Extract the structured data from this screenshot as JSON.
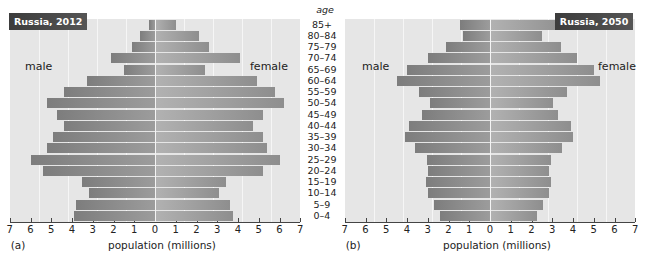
{
  "age_header": "age",
  "age_groups": [
    "85+",
    "80–84",
    "75–79",
    "70–74",
    "65–69",
    "60–64",
    "55–59",
    "50–54",
    "45–49",
    "40–44",
    "35–39",
    "30–34",
    "25–29",
    "20–24",
    "15–19",
    "10–14",
    "5–9",
    "0–4"
  ],
  "axis_ticks": [
    "7",
    "6",
    "5",
    "4",
    "3",
    "2",
    "1",
    "0",
    "1",
    "2",
    "3",
    "4",
    "5",
    "6",
    "7"
  ],
  "panels": [
    {
      "panel_label": "(a)",
      "title": "Russia, 2012",
      "male_label": "male",
      "female_label": "female",
      "xlabel": "population (millions)"
    },
    {
      "panel_label": "(b)",
      "title": "Russia, 2050",
      "male_label": "male",
      "female_label": "female",
      "xlabel": "population (millions)"
    }
  ],
  "colors": {
    "plot_bg": "#e6e6e6",
    "male_bar": "#8c8c8c",
    "female_bar": "#a4a4a4",
    "badge_bg": "#444444"
  },
  "chart_data": [
    {
      "type": "bar",
      "orientation": "horizontal-population-pyramid",
      "title": "Russia, 2012",
      "panel": "(a)",
      "xlabel": "population (millions)",
      "ylabel": "age",
      "xlim": [
        -7,
        7
      ],
      "grid": true,
      "categories": [
        "85+",
        "80–84",
        "75–79",
        "70–74",
        "65–69",
        "60–64",
        "55–59",
        "50–54",
        "45–49",
        "40–44",
        "35–39",
        "30–34",
        "25–29",
        "20–24",
        "15–19",
        "10–14",
        "5–9",
        "0–4"
      ],
      "series": [
        {
          "name": "male",
          "values": [
            0.3,
            0.7,
            1.1,
            2.1,
            1.5,
            3.3,
            4.4,
            5.2,
            4.7,
            4.4,
            4.9,
            5.2,
            6.0,
            5.4,
            3.5,
            3.2,
            3.8,
            3.9
          ]
        },
        {
          "name": "female",
          "values": [
            1.0,
            2.1,
            2.6,
            4.1,
            2.4,
            4.9,
            5.8,
            6.2,
            5.2,
            4.7,
            5.2,
            5.4,
            6.0,
            5.2,
            3.4,
            3.1,
            3.6,
            3.75
          ]
        }
      ]
    },
    {
      "type": "bar",
      "orientation": "horizontal-population-pyramid",
      "title": "Russia, 2050",
      "panel": "(b)",
      "xlabel": "population (millions)",
      "ylabel": "age",
      "xlim": [
        -7,
        7
      ],
      "grid": true,
      "categories": [
        "85+",
        "80–84",
        "75–79",
        "70–74",
        "65–69",
        "60–64",
        "55–59",
        "50–54",
        "45–49",
        "40–44",
        "35–39",
        "30–34",
        "25–29",
        "20–24",
        "15–19",
        "10–14",
        "5–9",
        "0–4"
      ],
      "series": [
        {
          "name": "male",
          "values": [
            1.45,
            1.3,
            2.1,
            3.0,
            4.0,
            4.5,
            3.4,
            2.9,
            3.3,
            3.9,
            4.1,
            3.6,
            3.05,
            3.0,
            3.1,
            3.0,
            2.7,
            2.4
          ]
        },
        {
          "name": "female",
          "values": [
            3.7,
            2.5,
            3.4,
            4.2,
            5.0,
            5.3,
            3.7,
            3.05,
            3.3,
            3.9,
            4.0,
            3.45,
            2.95,
            2.85,
            2.95,
            2.85,
            2.55,
            2.25
          ]
        }
      ]
    }
  ]
}
